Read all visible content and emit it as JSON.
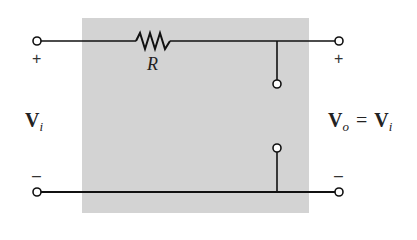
{
  "diagram": {
    "type": "circuit",
    "resistor": {
      "label": "R"
    },
    "input": {
      "plus": "+",
      "minus": "–",
      "voltage_symbol": "V",
      "voltage_subscript": "i"
    },
    "output": {
      "plus": "+",
      "minus": "–",
      "lhs_symbol": "V",
      "lhs_subscript": "o",
      "equals": "=",
      "rhs_symbol": "V",
      "rhs_subscript": "i"
    },
    "colors": {
      "block_fill": "#d3d3d3",
      "wire": "#111111",
      "terminal_fill": "#ffffff"
    }
  }
}
